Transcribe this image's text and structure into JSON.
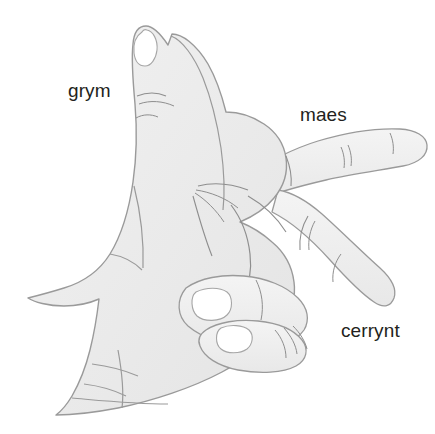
{
  "figure": {
    "background_color": "#ffffff",
    "width": 435,
    "height": 434
  },
  "labels": [
    {
      "id": "grym",
      "text": "grym",
      "x": 68,
      "y": 81,
      "points_to": "thumb"
    },
    {
      "id": "maes",
      "text": "maes",
      "x": 300,
      "y": 105,
      "points_to": "index-finger"
    },
    {
      "id": "cerrynt",
      "text": "cerrynt",
      "x": 341,
      "y": 321,
      "points_to": "middle-finger"
    }
  ],
  "colors": {
    "skin_fill": "#ececec",
    "skin_fill_light": "#f2f2f2",
    "outline": "#9a9a9a",
    "crease": "#8e8e8e",
    "nail_fill": "#ffffff",
    "nail_outline": "#a6a6a6",
    "text": "#231f20",
    "background": "#ffffff"
  },
  "illustration": {
    "type": "line-drawing",
    "subject": "right hand, thumb up, index finger pointing right, middle finger extended down-right, ring and little fingers curled",
    "parts": [
      {
        "name": "thumb",
        "description": "extends upward from palm, nail visible at tip"
      },
      {
        "name": "index-finger",
        "description": "points horizontally to the right, two knuckle creases"
      },
      {
        "name": "middle-finger",
        "description": "extends diagonally down to the right, two knuckle creases"
      },
      {
        "name": "ring-finger",
        "description": "curled into palm, white nail visible"
      },
      {
        "name": "little-finger",
        "description": "curled into palm, white nail visible"
      },
      {
        "name": "palm",
        "description": "creases radiating from thumb web"
      },
      {
        "name": "wrist",
        "description": "extends to lower left edge"
      }
    ]
  }
}
